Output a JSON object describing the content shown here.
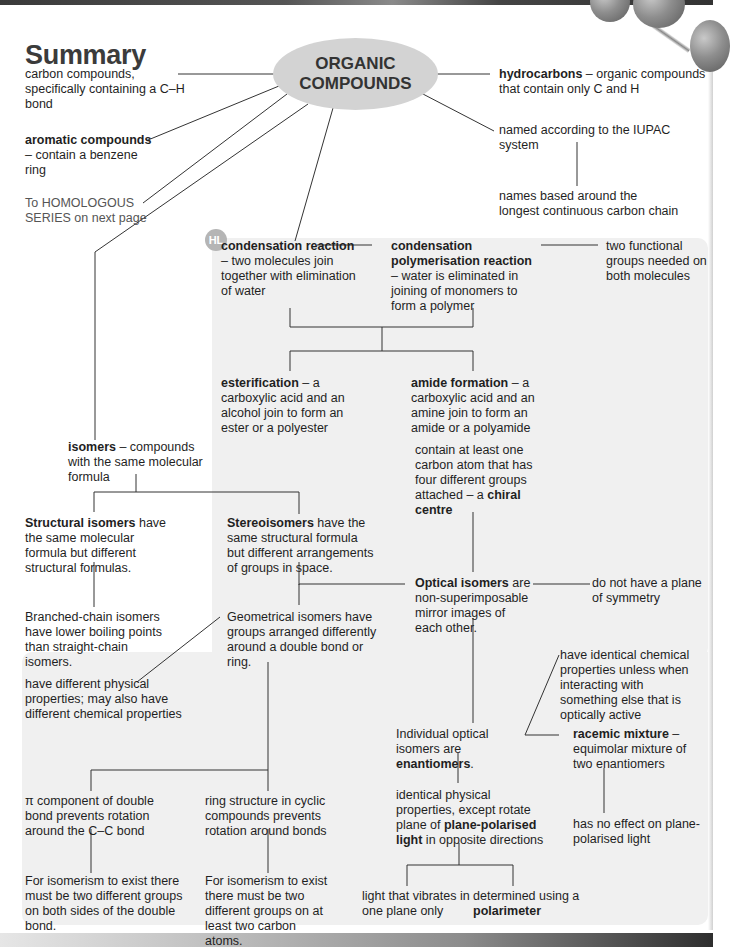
{
  "page": {
    "title": "Summary",
    "central_node": [
      "ORGANIC",
      "COMPOUNDS"
    ],
    "hl_badge": "HL"
  },
  "colors": {
    "ellipse_fill": "#d3d3d3",
    "hl_panel_fill": "#f0f0f0",
    "hl_badge_fill": "#b5b5b5",
    "line": "#333333",
    "text": "#1f1f1f"
  },
  "nodes": {
    "carbon_compounds": {
      "text": "carbon compounds, specifically containing a C–H bond"
    },
    "aromatic": {
      "bold": "aromatic compounds",
      "text": " – contain a benzene ring"
    },
    "homologous_link": {
      "text": "To HOMOLOGOUS SERIES on next page"
    },
    "hydrocarbons": {
      "bold": "hydrocarbons",
      "text": " – organic compounds that contain only C and H"
    },
    "iupac": {
      "text": "named according to the IUPAC system"
    },
    "longest_chain": {
      "text": "names based around the longest continuous carbon chain"
    },
    "condensation": {
      "bold": "condensation reaction",
      "text": " – two molecules join together with elimination of water"
    },
    "condensation_poly": {
      "bold": "condensation polymerisation reaction",
      "text": " – water is eliminated in joining of monomers to form a polymer"
    },
    "functional_groups": {
      "text": "two functional groups needed on both molecules"
    },
    "esterification": {
      "bold": "esterification",
      "text": " – a carboxylic acid and an alcohol join to form an ester or a polyester"
    },
    "amide": {
      "bold": "amide formation",
      "text": " – a carboxylic acid and an amine join to form an amide or a polyamide"
    },
    "isomers": {
      "bold": "isomers",
      "text": " – compounds with the same molecular formula"
    },
    "structural": {
      "bold": "Structural isomers",
      "text": " have the same molecular formula but different structural formulas."
    },
    "branched": {
      "text": "Branched-chain isomers have lower boiling points than straight-chain isomers."
    },
    "stereo": {
      "bold": "Stereoisomers",
      "text": " have the same structural formula but different arrangements of groups in space."
    },
    "chiral": {
      "text": "contain at least one carbon atom that has four different groups attached – a ",
      "bold": "chiral centre"
    },
    "optical": {
      "bold": "Optical isomers",
      "text": " are non-superimposable mirror images of each other."
    },
    "no_symmetry": {
      "text": "do not have a plane of symmetry"
    },
    "geometrical": {
      "text": "Geometrical isomers have groups arranged differently around a double bond or ring."
    },
    "different_props": {
      "text": "have different physical properties; may also have different chemical properties"
    },
    "identical_chem": {
      "text": "have identical chemical properties unless when interacting with something else that is optically active"
    },
    "enantiomers": {
      "text": "Individual optical isomers are ",
      "bold": "enantiomers",
      "tail": "."
    },
    "racemic": {
      "bold": "racemic mixture",
      "text": " – equimolar mixture of two enantiomers"
    },
    "pi_component": {
      "text": "π component of double bond prevents rotation around the C–C bond"
    },
    "ring_structure": {
      "text": "ring structure in cyclic compounds prevents rotation around bonds"
    },
    "identical_phys": {
      "text1": "identical physical properties, except rotate plane of ",
      "bold1": "plane-polarised light",
      "text2": " in opposite directions"
    },
    "no_effect": {
      "text": "has no effect on plane-polarised light"
    },
    "double_bond_req": {
      "text": "For isomerism to exist there must be two different groups on both sides of the double bond."
    },
    "ring_req": {
      "text": "For isomerism to exist there must be two different groups on at least two carbon atoms."
    },
    "one_plane": {
      "text": "light that vibrates in one plane only"
    },
    "polarimeter": {
      "text": "determined using a ",
      "bold": "polarimeter"
    }
  }
}
